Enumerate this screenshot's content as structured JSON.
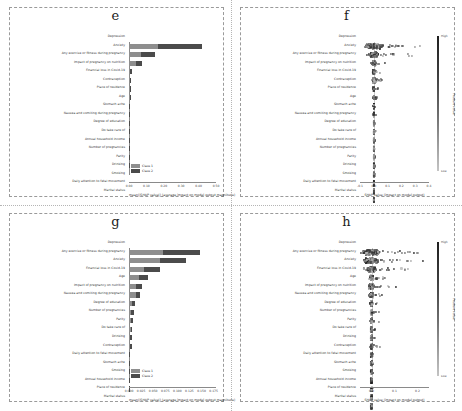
{
  "figure": {
    "panels": [
      "e",
      "f",
      "g",
      "h"
    ],
    "legend_labels": [
      "Class 1",
      "Class 2"
    ],
    "colors": {
      "class1": "#8e8e8e",
      "class2": "#4b4b4b",
      "feature_high": "#1f1f1f",
      "feature_low": "#c4c4c4",
      "frame": "#9a9a9a"
    },
    "colorbar": {
      "title": "Feature value",
      "high_label": "High",
      "low_label": "Low"
    }
  },
  "chart_data": [
    {
      "panel": "e",
      "type": "bar",
      "title": "e",
      "xlabel": "mean(|SHAP value|) (average impact on model output magnitude)",
      "ylabel": "",
      "xlim": [
        0,
        0.5
      ],
      "xticks": [
        0.0,
        0.1,
        0.2,
        0.3,
        0.4,
        0.5
      ],
      "xtick_labels": [
        "0.00",
        "0.10",
        "0.20",
        "0.30",
        "0.40",
        "0.50"
      ],
      "grid": false,
      "legend": [
        "Class 1",
        "Class 2"
      ],
      "legend_position": "lower left",
      "categories": [
        "Depression",
        "Anxiety",
        "Any exercise or fitness during pregnancy",
        "Impact of pregnancy on nutrition",
        "Financial loss in Covid-19",
        "Contraception",
        "Place of residence",
        "Age",
        "Stomach ache",
        "Nausea and vomiting during pregnancy",
        "Degree of education",
        "Do take care of",
        "Annual household income",
        "Number of pregnancies",
        "Parity",
        "Drinking",
        "Smoking",
        "Daily attention to fetal movement",
        "Marital status"
      ],
      "series": [
        {
          "name": "Class 1",
          "values": [
            0.168,
            0.071,
            0.041,
            0.0075,
            0.0065,
            0.004,
            0.0035,
            0.0028,
            0.0022,
            0.0016,
            0.0013,
            0.0011,
            0.0009,
            0.0008,
            0.0005,
            0.0004,
            0.0003,
            0.0002,
            0.0001
          ]
        },
        {
          "name": "Class 2",
          "values": [
            0.252,
            0.078,
            0.034,
            0.0075,
            0.0065,
            0.004,
            0.0035,
            0.0028,
            0.0022,
            0.0016,
            0.0013,
            0.0011,
            0.0009,
            0.0008,
            0.0005,
            0.0004,
            0.0003,
            0.0002,
            0.0001
          ]
        }
      ]
    },
    {
      "panel": "f",
      "type": "scatter",
      "title": "f",
      "xlabel": "SHAP value (impact on model output)",
      "ylabel": "",
      "xlim": [
        -0.1,
        0.4
      ],
      "xticks": [
        -0.1,
        0.0,
        0.1,
        0.2,
        0.3,
        0.4
      ],
      "xtick_labels": [
        "-0.1",
        "0.0",
        "0.1",
        "0.2",
        "0.3",
        "0.4"
      ],
      "grid": false,
      "colorbar": "Feature value",
      "categories": [
        "Depression",
        "Anxiety",
        "Any exercise or fitness during pregnancy",
        "Impact of pregnancy on nutrition",
        "Financial loss in Covid-19",
        "Contraception",
        "Place of residence",
        "Age",
        "Stomach ache",
        "Nausea and vomiting during pregnancy",
        "Degree of education",
        "Do take care of",
        "Annual household income",
        "Number of pregnancies",
        "Parity",
        "Drinking",
        "Smoking",
        "Daily attention to fetal movement",
        "Marital status"
      ],
      "spread": [
        0.4,
        0.2,
        0.075,
        0.055,
        0.06,
        0.022,
        0.018,
        0.016,
        0.014,
        0.012,
        0.011,
        0.01,
        0.009,
        0.008,
        0.007,
        0.006,
        0.005,
        0.004,
        0.003
      ]
    },
    {
      "panel": "g",
      "type": "bar",
      "title": "g",
      "xlabel": "mean(|SHAP value|) (average impact on model output magnitude)",
      "ylabel": "",
      "xlim": [
        0,
        0.18
      ],
      "xticks": [
        0.0,
        0.025,
        0.05,
        0.075,
        0.1,
        0.125,
        0.15,
        0.175
      ],
      "xtick_labels": [
        "0.000",
        "0.025",
        "0.050",
        "0.075",
        "0.100",
        "0.125",
        "0.150",
        "0.175"
      ],
      "grid": false,
      "legend": [
        "Class 1",
        "Class 2"
      ],
      "legend_position": "lower left",
      "categories": [
        "Depression",
        "Any exercise or fitness during pregnancy",
        "Anxiety",
        "Financial loss in Covid-19",
        "Age",
        "Impact of pregnancy on nutrition",
        "Nausea and vomiting during pregnancy",
        "Degree of education",
        "Number of pregnancies",
        "Parity",
        "Do take care of",
        "Drinking",
        "Contraception",
        "Daily attention to fetal movement",
        "Stomach ache",
        "Smoking",
        "Annual household income",
        "Place of residence",
        "Marital status"
      ],
      "series": [
        {
          "name": "Class 1",
          "values": [
            0.07,
            0.064,
            0.03,
            0.02,
            0.0145,
            0.0135,
            0.0062,
            0.005,
            0.0044,
            0.0034,
            0.003,
            0.0028,
            0.0004,
            0.0003,
            0.0003,
            0.0002,
            0.0002,
            0.0001,
            0.0001
          ]
        },
        {
          "name": "Class 2",
          "values": [
            0.076,
            0.053,
            0.0345,
            0.02,
            0.0125,
            0.01,
            0.0062,
            0.005,
            0.0044,
            0.0034,
            0.003,
            0.0028,
            0.0004,
            0.0003,
            0.0003,
            0.0002,
            0.0002,
            0.0001,
            0.0001
          ]
        }
      ]
    },
    {
      "panel": "h",
      "type": "scatter",
      "title": "h",
      "xlabel": "SHAP value (impact on model output)",
      "ylabel": "",
      "xlim": [
        -0.05,
        0.25
      ],
      "xticks": [
        0.0,
        0.1,
        0.2
      ],
      "xtick_labels": [
        "0.0",
        "0.1",
        "0.2"
      ],
      "grid": false,
      "colorbar": "Feature value",
      "categories": [
        "Depression",
        "Any exercise or fitness during pregnancy",
        "Anxiety",
        "Financial loss in Covid-19",
        "Age",
        "Impact of pregnancy on nutrition",
        "Nausea and vomiting during pregnancy",
        "Degree of education",
        "Number of pregnancies",
        "Parity",
        "Do take care of",
        "Drinking",
        "Contraception",
        "Daily attention to fetal movement",
        "Stomach ache",
        "Smoking",
        "Annual household income",
        "Place of residence",
        "Marital status"
      ],
      "spread": [
        0.24,
        0.2,
        0.13,
        0.06,
        0.085,
        0.045,
        0.035,
        0.028,
        0.025,
        0.02,
        0.016,
        0.03,
        0.008,
        0.007,
        0.006,
        0.005,
        0.004,
        0.003,
        0.003
      ]
    }
  ]
}
